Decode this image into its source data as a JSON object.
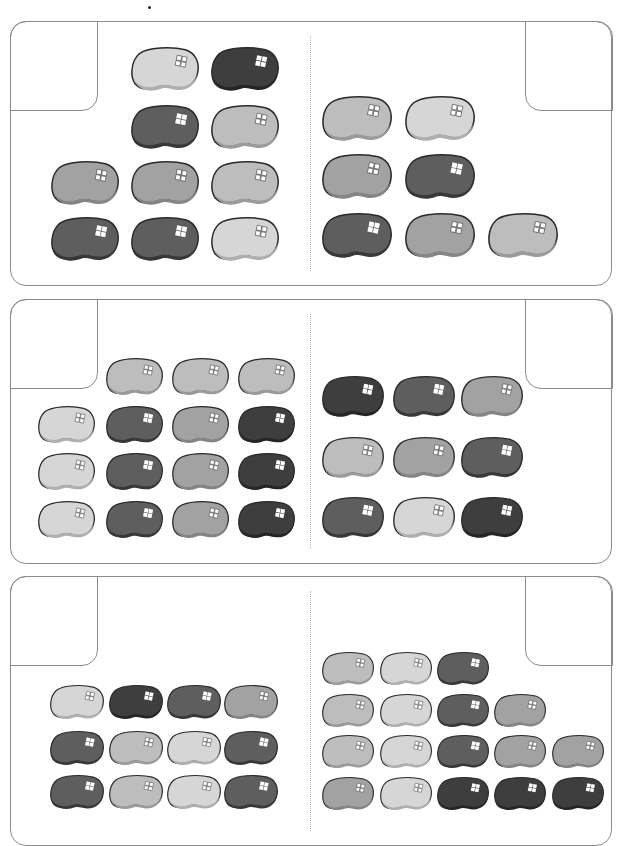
{
  "worksheet": {
    "shades": {
      "light": "#d6d6d6",
      "lightmed": "#bdbdbd",
      "medium": "#a2a2a2",
      "dark": "#5e5e5e",
      "darkest": "#3e3e3e"
    },
    "border_color": "#8c8c8c",
    "panels": [
      {
        "id": "panel-1",
        "top": 21,
        "height": 265,
        "left_group": {
          "bean_w": 68,
          "bean_h": 45,
          "beans": [
            {
              "x": 131,
              "y": 47,
              "shade": "light"
            },
            {
              "x": 211,
              "y": 47,
              "shade": "darkest"
            },
            {
              "x": 131,
              "y": 105,
              "shade": "dark"
            },
            {
              "x": 211,
              "y": 105,
              "shade": "lightmed"
            },
            {
              "x": 51,
              "y": 161,
              "shade": "medium"
            },
            {
              "x": 131,
              "y": 161,
              "shade": "medium"
            },
            {
              "x": 211,
              "y": 161,
              "shade": "lightmed"
            },
            {
              "x": 51,
              "y": 217,
              "shade": "dark"
            },
            {
              "x": 131,
              "y": 217,
              "shade": "dark"
            },
            {
              "x": 211,
              "y": 217,
              "shade": "light"
            }
          ]
        },
        "right_group": {
          "bean_w": 70,
          "bean_h": 46,
          "beans": [
            {
              "x": 322,
              "y": 96,
              "shade": "lightmed"
            },
            {
              "x": 405,
              "y": 96,
              "shade": "light"
            },
            {
              "x": 322,
              "y": 154,
              "shade": "medium"
            },
            {
              "x": 405,
              "y": 154,
              "shade": "dark"
            },
            {
              "x": 322,
              "y": 213,
              "shade": "dark"
            },
            {
              "x": 405,
              "y": 213,
              "shade": "medium"
            },
            {
              "x": 488,
              "y": 213,
              "shade": "lightmed"
            }
          ]
        }
      },
      {
        "id": "panel-2",
        "top": 299,
        "height": 265,
        "left_group": {
          "bean_w": 57,
          "bean_h": 38,
          "beans": [
            {
              "x": 106,
              "y": 358,
              "shade": "lightmed"
            },
            {
              "x": 172,
              "y": 358,
              "shade": "lightmed"
            },
            {
              "x": 238,
              "y": 358,
              "shade": "lightmed"
            },
            {
              "x": 38,
              "y": 406,
              "shade": "light"
            },
            {
              "x": 106,
              "y": 406,
              "shade": "dark"
            },
            {
              "x": 172,
              "y": 406,
              "shade": "medium"
            },
            {
              "x": 238,
              "y": 406,
              "shade": "darkest"
            },
            {
              "x": 38,
              "y": 453,
              "shade": "light"
            },
            {
              "x": 106,
              "y": 453,
              "shade": "dark"
            },
            {
              "x": 172,
              "y": 453,
              "shade": "medium"
            },
            {
              "x": 238,
              "y": 453,
              "shade": "darkest"
            },
            {
              "x": 38,
              "y": 501,
              "shade": "light"
            },
            {
              "x": 106,
              "y": 501,
              "shade": "dark"
            },
            {
              "x": 172,
              "y": 501,
              "shade": "medium"
            },
            {
              "x": 238,
              "y": 501,
              "shade": "darkest"
            }
          ]
        },
        "right_group": {
          "bean_w": 62,
          "bean_h": 42,
          "beans": [
            {
              "x": 322,
              "y": 376,
              "shade": "darkest"
            },
            {
              "x": 393,
              "y": 376,
              "shade": "dark"
            },
            {
              "x": 461,
              "y": 376,
              "shade": "medium"
            },
            {
              "x": 322,
              "y": 437,
              "shade": "lightmed"
            },
            {
              "x": 393,
              "y": 437,
              "shade": "medium"
            },
            {
              "x": 461,
              "y": 437,
              "shade": "dark"
            },
            {
              "x": 322,
              "y": 497,
              "shade": "dark"
            },
            {
              "x": 393,
              "y": 497,
              "shade": "light"
            },
            {
              "x": 461,
              "y": 497,
              "shade": "darkest"
            }
          ]
        }
      },
      {
        "id": "panel-3",
        "top": 576,
        "height": 270,
        "left_group": {
          "bean_w": 54,
          "bean_h": 35,
          "beans": [
            {
              "x": 50,
              "y": 685,
              "shade": "light"
            },
            {
              "x": 109,
              "y": 685,
              "shade": "darkest"
            },
            {
              "x": 167,
              "y": 685,
              "shade": "dark"
            },
            {
              "x": 224,
              "y": 685,
              "shade": "medium"
            },
            {
              "x": 50,
              "y": 731,
              "shade": "dark"
            },
            {
              "x": 109,
              "y": 731,
              "shade": "lightmed"
            },
            {
              "x": 167,
              "y": 731,
              "shade": "light"
            },
            {
              "x": 224,
              "y": 731,
              "shade": "dark"
            },
            {
              "x": 50,
              "y": 775,
              "shade": "dark"
            },
            {
              "x": 109,
              "y": 775,
              "shade": "lightmed"
            },
            {
              "x": 167,
              "y": 775,
              "shade": "light"
            },
            {
              "x": 224,
              "y": 775,
              "shade": "dark"
            }
          ]
        },
        "right_group": {
          "bean_w": 52,
          "bean_h": 34,
          "beans": [
            {
              "x": 322,
              "y": 652,
              "shade": "lightmed"
            },
            {
              "x": 380,
              "y": 652,
              "shade": "light"
            },
            {
              "x": 437,
              "y": 652,
              "shade": "dark"
            },
            {
              "x": 322,
              "y": 694,
              "shade": "lightmed"
            },
            {
              "x": 380,
              "y": 694,
              "shade": "light"
            },
            {
              "x": 437,
              "y": 694,
              "shade": "dark"
            },
            {
              "x": 494,
              "y": 694,
              "shade": "medium"
            },
            {
              "x": 322,
              "y": 735,
              "shade": "lightmed"
            },
            {
              "x": 380,
              "y": 735,
              "shade": "light"
            },
            {
              "x": 437,
              "y": 735,
              "shade": "dark"
            },
            {
              "x": 494,
              "y": 735,
              "shade": "medium"
            },
            {
              "x": 552,
              "y": 735,
              "shade": "medium"
            },
            {
              "x": 322,
              "y": 777,
              "shade": "medium"
            },
            {
              "x": 380,
              "y": 777,
              "shade": "light"
            },
            {
              "x": 437,
              "y": 777,
              "shade": "darkest"
            },
            {
              "x": 494,
              "y": 777,
              "shade": "darkest"
            },
            {
              "x": 552,
              "y": 777,
              "shade": "darkest"
            }
          ]
        }
      }
    ],
    "counts": [
      {
        "panel": 1,
        "left": 10,
        "right": 7
      },
      {
        "panel": 2,
        "left": 15,
        "right": 9
      },
      {
        "panel": 3,
        "left": 12,
        "right": 17
      }
    ]
  }
}
